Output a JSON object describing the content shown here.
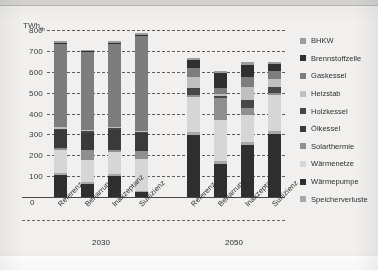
{
  "chart_data": {
    "type": "bar",
    "stacked": true,
    "title": "",
    "subtitle": "",
    "xlabel": "",
    "ylabel": "TWh_th",
    "y_unit_display": "TWh",
    "y_unit_subscript": "th",
    "ylim": [
      0,
      800
    ],
    "yticks": [
      0,
      100,
      200,
      300,
      400,
      500,
      600,
      700,
      800
    ],
    "ytick_labels": [
      "0",
      "100",
      "200",
      "300",
      "400",
      "500",
      "600",
      "700",
      "800"
    ],
    "grid": "horizontal-dashed",
    "legend_position": "right",
    "zero_label": "0",
    "groups": [
      {
        "name": "2030",
        "categories": [
          "Referenz",
          "Beharrung",
          "Inakzeptanz",
          "Suffizienz"
        ]
      },
      {
        "name": "2050",
        "categories": [
          "Referenz",
          "Beharrung",
          "Inakzeptanz",
          "Suffizienz"
        ]
      }
    ],
    "categories": [
      "Referenz 2030",
      "Beharrung 2030",
      "Inakzeptanz 2030",
      "Suffizienz 2030",
      "Referenz 2050",
      "Beharrung 2050",
      "Inakzeptanz 2050",
      "Suffizienz 2050"
    ],
    "series": [
      {
        "name": "Wärmepumpe",
        "color": "#2f2f2f",
        "values": [
          105,
          62,
          100,
          22,
          295,
          160,
          250,
          300
        ]
      },
      {
        "name": "Speicherverluste",
        "color": "#a8a8a8",
        "values": [
          8,
          8,
          8,
          8,
          14,
          14,
          14,
          14
        ]
      },
      {
        "name": "Wärmenetze",
        "color": "#d6d6d6",
        "values": [
          110,
          108,
          108,
          150,
          170,
          195,
          130,
          175
        ]
      },
      {
        "name": "Solarthermie",
        "color": "#8f8f8f",
        "values": [
          12,
          48,
          10,
          40,
          10,
          105,
          30,
          10
        ]
      },
      {
        "name": "Ölkessel",
        "color": "#3a3a3a",
        "values": [
          85,
          80,
          95,
          85,
          0,
          0,
          0,
          0
        ]
      },
      {
        "name": "Holzkessel",
        "color": "#474747",
        "values": [
          8,
          8,
          8,
          8,
          32,
          10,
          40,
          30
        ]
      },
      {
        "name": "Heizstab",
        "color": "#bfbfbf",
        "values": [
          5,
          5,
          5,
          5,
          55,
          10,
          65,
          35
        ]
      },
      {
        "name": "Gaskessel",
        "color": "#7d7d7d",
        "values": [
          400,
          375,
          400,
          455,
          40,
          30,
          45,
          40
        ]
      },
      {
        "name": "Brennstoffzelle",
        "color": "#303030",
        "values": [
          5,
          5,
          5,
          5,
          40,
          70,
          60,
          35
        ]
      },
      {
        "name": "BHKW",
        "color": "#9d9d9d",
        "values": [
          7,
          6,
          6,
          7,
          9,
          11,
          11,
          9
        ]
      }
    ],
    "totals": [
      745,
      705,
      745,
      785,
      665,
      605,
      645,
      648
    ],
    "legend_entries": [
      "BHKW",
      "Brennstoffzelle",
      "Gaskessel",
      "Heizstab",
      "Holzkessel",
      "Ölkessel",
      "Solarthermie",
      "Wärmenetze",
      "Wärmepumpe",
      "Speicherverluste"
    ],
    "legend_colors": {
      "BHKW": "#9d9d9d",
      "Brennstoffzelle": "#303030",
      "Gaskessel": "#7d7d7d",
      "Heizstab": "#bfbfbf",
      "Holzkessel": "#474747",
      "Ölkessel": "#3a3a3a",
      "Solarthermie": "#8f8f8f",
      "Wärmenetze": "#d6d6d6",
      "Wärmepumpe": "#2f2f2f",
      "Speicherverluste": "#a8a8a8"
    },
    "palette": {
      "background": "#f1f0ee",
      "gridline": "#5d5c5a",
      "axis": "#4a4948",
      "text": "#2f2e2d"
    }
  }
}
